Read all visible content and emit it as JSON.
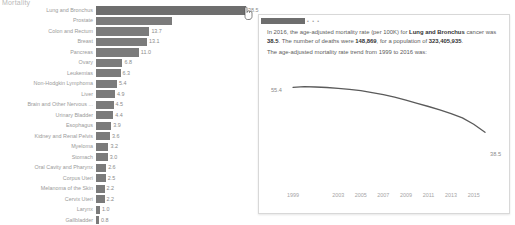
{
  "chart_title": "Mortality",
  "chart_data": {
    "type": "bar",
    "orientation": "horizontal",
    "title": "Mortality",
    "xlabel": "",
    "ylabel": "",
    "categories": [
      "Lung and Bronchus",
      "Prostate",
      "Colon and Rectum",
      "Breast",
      "Pancreas",
      "Ovary",
      "Leukemias",
      "Non-Hodgkin Lymphoma",
      "Liver",
      "Brain and Other Nervous ...",
      "Urinary Bladder",
      "Esophagus",
      "Kidney and Renal Pelvis",
      "Myeloma",
      "Stomach",
      "Oral Cavity and Pharynx",
      "Corpus Uteri",
      "Melanoma of the Skin",
      "Cervix Uteri",
      "Larynx",
      "Gallbladder",
      "Thyroid"
    ],
    "values": [
      38.5,
      19.5,
      13.7,
      13.1,
      11.0,
      6.8,
      6.3,
      5.4,
      4.9,
      4.5,
      4.4,
      3.9,
      3.6,
      3.2,
      3.0,
      2.6,
      2.5,
      2.2,
      2.2,
      1.0,
      0.8,
      0.5
    ],
    "value_labels": [
      "38.5",
      "",
      "13.7",
      "13.1",
      "11.0",
      "6.8",
      "6.3",
      "5.4",
      "4.9",
      "4.5",
      "4.4",
      "3.9",
      "3.6",
      "3.2",
      "3.0",
      "2.6",
      "2.5",
      "2.2",
      "2.2",
      "1.0",
      "0.8",
      "0.5"
    ],
    "highlighted_category": "Lung and Bronchus",
    "xlim": [
      0,
      38.5
    ]
  },
  "tooltip": {
    "header_dots": "• • •",
    "line1_a": "In 2016, the age-adjusted mortality rate (per 100K) for ",
    "line1_cancer": "Lung and Bronchus",
    "line1_b": " cancer was ",
    "line1_rate": "38.5",
    "line1_c": ". The number of deaths were ",
    "line1_deaths": "148,869",
    "line1_d": ", for a population of ",
    "line1_population": "323,405,935",
    "line1_e": ".",
    "subtitle": "The age-adjusted mortality rate trend from 1999 to 2016 was:",
    "trend": {
      "type": "line",
      "title": "The age-adjusted mortality rate trend from 1999 to 2016 was:",
      "xlabel": "",
      "ylabel": "",
      "x": [
        1999,
        2000,
        2001,
        2002,
        2003,
        2004,
        2005,
        2006,
        2007,
        2008,
        2009,
        2010,
        2011,
        2012,
        2013,
        2014,
        2015,
        2016
      ],
      "values": [
        55.4,
        55.6,
        55.5,
        55.3,
        55.0,
        54.6,
        54.1,
        53.4,
        52.6,
        51.7,
        50.6,
        49.4,
        48.2,
        46.9,
        45.5,
        43.9,
        41.5,
        38.5
      ],
      "start_label": "55.4",
      "end_label": "38.5",
      "tick_labels": [
        "1999",
        "2003",
        "2005",
        "2007",
        "2009",
        "2011",
        "2013",
        "2015"
      ],
      "ylim": [
        36,
        57
      ]
    }
  },
  "colors": {
    "bar": "#7b7b7b",
    "bar_highlight": "#6e6e6e",
    "line": "#5a5a5a",
    "text": "#5c5c5c",
    "muted": "#9a9a9a",
    "panel_border": "#d8d8d8"
  }
}
